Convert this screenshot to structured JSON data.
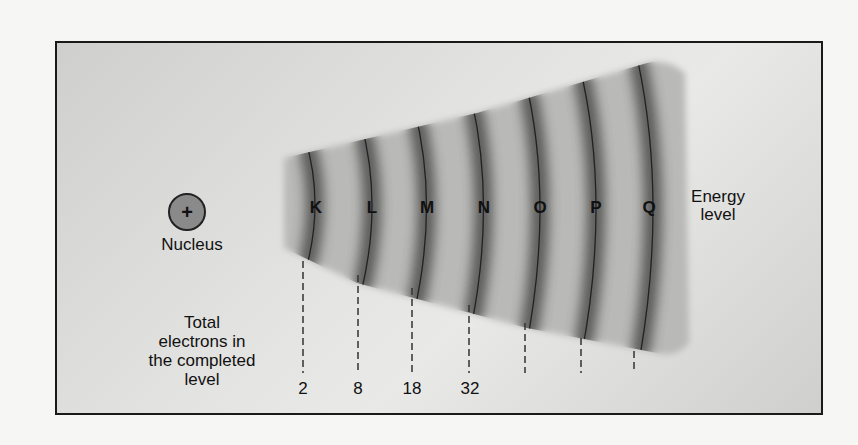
{
  "diagram": {
    "nucleus": {
      "symbol": "+",
      "label": "Nucleus"
    },
    "energy_level_label": "Energy level",
    "energy_level_label_lines": [
      "Energy",
      "level"
    ],
    "total_label_lines": [
      "Total",
      "electrons in",
      "the completed",
      "level"
    ],
    "levels": [
      {
        "letter": "K",
        "electrons": "2"
      },
      {
        "letter": "L",
        "electrons": "8"
      },
      {
        "letter": "M",
        "electrons": "18"
      },
      {
        "letter": "N",
        "electrons": "32"
      },
      {
        "letter": "O",
        "electrons": ""
      },
      {
        "letter": "P",
        "electrons": ""
      },
      {
        "letter": "Q",
        "electrons": ""
      }
    ]
  }
}
